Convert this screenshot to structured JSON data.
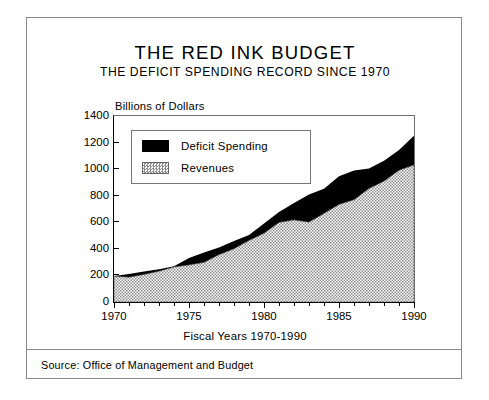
{
  "figure": {
    "title": "THE RED INK BUDGET",
    "subtitle": "THE DEFICIT SPENDING RECORD SINCE 1970",
    "source_note": "Source:  Office of Management and Budget"
  },
  "legend": {
    "deficit_label": "Deficit Spending",
    "revenues_label": "Revenues"
  },
  "chart_data": {
    "type": "area",
    "stacked": true,
    "title": "THE RED INK BUDGET",
    "subtitle": "THE DEFICIT SPENDING RECORD SINCE 1970",
    "xlabel": "Fiscal Years 1970-1990",
    "ylabel": "Billions of Dollars",
    "ylabel_position": "above-axis",
    "xlim": [
      1970,
      1990
    ],
    "ylim": [
      0,
      1400
    ],
    "yticks": [
      0,
      200,
      400,
      600,
      800,
      1000,
      1200,
      1400
    ],
    "xticks": [
      1970,
      1975,
      1980,
      1985,
      1990
    ],
    "xticks_minor_step": 1,
    "grid": false,
    "legend_position": "upper-left-inside",
    "x": [
      1970,
      1971,
      1972,
      1973,
      1974,
      1975,
      1976,
      1977,
      1978,
      1979,
      1980,
      1981,
      1982,
      1983,
      1984,
      1985,
      1986,
      1987,
      1988,
      1989,
      1990
    ],
    "series": [
      {
        "name": "Revenues",
        "fill": "stipple-gray",
        "values": [
          193,
          187,
          207,
          231,
          263,
          279,
          298,
          356,
          400,
          463,
          517,
          599,
          618,
          601,
          667,
          734,
          769,
          854,
          909,
          991,
          1031
        ]
      },
      {
        "name": "Deficit Spending",
        "fill": "solid-black",
        "values": [
          3,
          23,
          23,
          15,
          6,
          53,
          74,
          54,
          59,
          41,
          74,
          79,
          128,
          208,
          185,
          212,
          221,
          150,
          155,
          153,
          220
        ]
      }
    ],
    "totals_note": "Top of stack = total outlays (revenues + deficit)",
    "totals": [
      196,
      210,
      230,
      246,
      269,
      332,
      372,
      410,
      459,
      504,
      591,
      678,
      746,
      809,
      852,
      946,
      990,
      1004,
      1064,
      1144,
      1251
    ],
    "colors": {
      "deficit": "#000000",
      "revenues": "#8d8d8d",
      "axis": "#000000",
      "frame": "#8a8a8a",
      "background": "#ffffff"
    }
  }
}
